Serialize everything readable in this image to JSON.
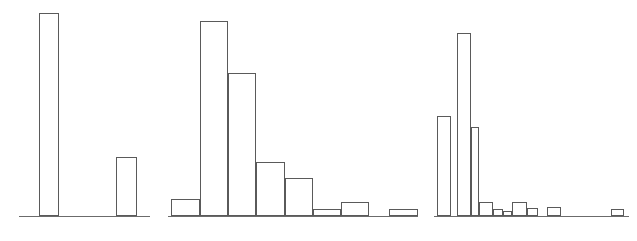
{
  "figure": {
    "title": "",
    "background_color": "#ffffff",
    "line_color": "#5a5a5a",
    "axis_color": "#6b6b6b",
    "width_px": 637,
    "height_px": 241,
    "panel_count": 3
  },
  "chart_data": [
    {
      "type": "bar",
      "name": "panel-1",
      "title": "",
      "xlabel": "",
      "ylabel": "",
      "grid": false,
      "legend": null,
      "bin_edges": [
        0,
        1,
        2,
        3,
        4
      ],
      "categories": [
        "bin-1",
        "bin-2",
        "bin-3",
        "bin-4"
      ],
      "values": [
        100,
        0,
        29,
        0
      ],
      "ylim": [
        0,
        100
      ],
      "xlim": [
        0,
        4
      ],
      "axis_x_start_px": 19,
      "axis_x_end_px": 150,
      "baseline_y_px": 216,
      "bars": [
        {
          "label": "bin-1",
          "x0_px": 39,
          "x1_px": 59,
          "value": 100,
          "top_y_px": 13
        },
        {
          "label": "bin-2",
          "x0_px": 59,
          "x1_px": 116,
          "value": 0,
          "top_y_px": 216
        },
        {
          "label": "bin-3",
          "x0_px": 116,
          "x1_px": 137,
          "value": 29,
          "top_y_px": 157
        },
        {
          "label": "bin-4",
          "x0_px": 137,
          "x1_px": 150,
          "value": 0,
          "top_y_px": 216
        }
      ]
    },
    {
      "type": "bar",
      "name": "panel-2",
      "title": "",
      "xlabel": "",
      "ylabel": "",
      "grid": false,
      "legend": null,
      "bin_edges": [
        0,
        1,
        2,
        3,
        4,
        5,
        6,
        7,
        8,
        9
      ],
      "categories": [
        "bin-1",
        "bin-2",
        "bin-3",
        "bin-4",
        "bin-5",
        "bin-6",
        "bin-7",
        "bin-8",
        "bin-9"
      ],
      "values": [
        16,
        96,
        73,
        29,
        20,
        3,
        8,
        0,
        3
      ],
      "ylim": [
        0,
        100
      ],
      "xlim": [
        0,
        9
      ],
      "axis_x_start_px": 168,
      "axis_x_end_px": 418,
      "baseline_y_px": 216,
      "bars": [
        {
          "label": "bin-1",
          "x0_px": 171,
          "x1_px": 200,
          "value": 16,
          "top_y_px": 199
        },
        {
          "label": "bin-2",
          "x0_px": 200,
          "x1_px": 228,
          "value": 96,
          "top_y_px": 21
        },
        {
          "label": "bin-3",
          "x0_px": 228,
          "x1_px": 256,
          "value": 73,
          "top_y_px": 73
        },
        {
          "label": "bin-4",
          "x0_px": 256,
          "x1_px": 285,
          "value": 29,
          "top_y_px": 162
        },
        {
          "label": "bin-5",
          "x0_px": 285,
          "x1_px": 313,
          "value": 20,
          "top_y_px": 178
        },
        {
          "label": "bin-6",
          "x0_px": 313,
          "x1_px": 341,
          "value": 3,
          "top_y_px": 209
        },
        {
          "label": "bin-7",
          "x0_px": 341,
          "x1_px": 369,
          "value": 8,
          "top_y_px": 202
        },
        {
          "label": "bin-8",
          "x0_px": 369,
          "x1_px": 389,
          "value": 0,
          "top_y_px": 216
        },
        {
          "label": "bin-9",
          "x0_px": 389,
          "x1_px": 418,
          "value": 3,
          "top_y_px": 209
        }
      ]
    },
    {
      "type": "bar",
      "name": "panel-3",
      "title": "",
      "xlabel": "",
      "ylabel": "",
      "grid": false,
      "legend": null,
      "bin_edges": [
        0,
        1,
        2,
        3,
        4,
        5,
        6,
        7,
        8,
        9,
        10,
        11,
        12,
        13,
        14
      ],
      "categories": [
        "bin-1",
        "bin-2",
        "bin-3",
        "bin-4",
        "bin-5",
        "bin-6",
        "bin-7",
        "bin-8",
        "bin-9",
        "bin-10",
        "bin-11",
        "bin-12",
        "bin-13",
        "bin-14"
      ],
      "values": [
        54,
        90,
        44,
        8,
        3,
        2,
        8,
        4,
        0,
        4,
        0,
        0,
        0,
        3
      ],
      "ylim": [
        0,
        100
      ],
      "xlim": [
        0,
        14
      ],
      "axis_x_start_px": 434,
      "axis_x_end_px": 629,
      "baseline_y_px": 216,
      "bars": [
        {
          "label": "bin-1",
          "x0_px": 437,
          "x1_px": 451,
          "value": 54,
          "top_y_px": 116
        },
        {
          "label": "bin-2",
          "x0_px": 457,
          "x1_px": 471,
          "value": 90,
          "top_y_px": 33
        },
        {
          "label": "bin-3",
          "x0_px": 471,
          "x1_px": 479,
          "value": 44,
          "top_y_px": 127
        },
        {
          "label": "bin-4",
          "x0_px": 479,
          "x1_px": 493,
          "value": 8,
          "top_y_px": 202
        },
        {
          "label": "bin-5",
          "x0_px": 493,
          "x1_px": 503,
          "value": 3,
          "top_y_px": 209
        },
        {
          "label": "bin-6",
          "x0_px": 503,
          "x1_px": 512,
          "value": 2,
          "top_y_px": 211
        },
        {
          "label": "bin-7",
          "x0_px": 512,
          "x1_px": 527,
          "value": 8,
          "top_y_px": 202
        },
        {
          "label": "bin-8",
          "x0_px": 527,
          "x1_px": 538,
          "value": 4,
          "top_y_px": 208
        },
        {
          "label": "bin-9",
          "x0_px": 538,
          "x1_px": 547,
          "value": 0,
          "top_y_px": 216
        },
        {
          "label": "bin-10",
          "x0_px": 547,
          "x1_px": 561,
          "value": 4,
          "top_y_px": 207
        },
        {
          "label": "bin-11",
          "x0_px": 561,
          "x1_px": 575,
          "value": 0,
          "top_y_px": 216
        },
        {
          "label": "bin-12",
          "x0_px": 575,
          "x1_px": 590,
          "value": 0,
          "top_y_px": 216
        },
        {
          "label": "bin-13",
          "x0_px": 590,
          "x1_px": 611,
          "value": 0,
          "top_y_px": 216
        },
        {
          "label": "bin-14",
          "x0_px": 611,
          "x1_px": 624,
          "value": 3,
          "top_y_px": 209
        }
      ]
    }
  ]
}
